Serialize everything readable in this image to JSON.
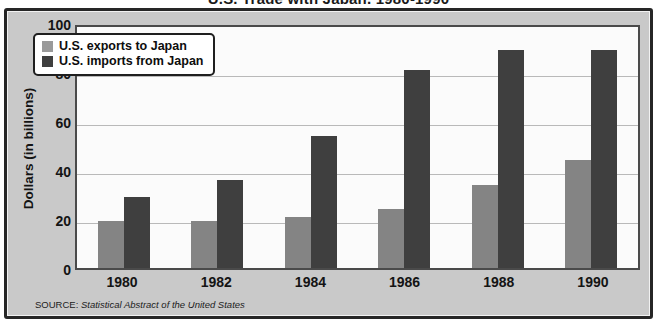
{
  "chart_data": {
    "type": "bar",
    "title": "U.S. Trade with Japan, 1980-1990",
    "xlabel": "",
    "ylabel": "Dollars (in billions)",
    "categories": [
      "1980",
      "1982",
      "1984",
      "1986",
      "1988",
      "1990"
    ],
    "series": [
      {
        "name": "U.S. exports to Japan",
        "color": "#848484",
        "values": [
          19,
          19,
          21,
          24,
          34,
          44
        ]
      },
      {
        "name": "U.S. imports from Japan",
        "color": "#3f3f3f",
        "values": [
          29,
          36,
          54,
          81,
          89,
          89
        ]
      }
    ],
    "ylim": [
      0,
      100
    ],
    "yticks": [
      100,
      80,
      60,
      40,
      20,
      0
    ],
    "grid": true,
    "legend_position": "top-left"
  },
  "source": {
    "label": "SOURCE:",
    "text": "Statistical Abstract of the United States"
  },
  "colors": {
    "panel_background": "#c9c9c9",
    "plot_background": "#fbfbfb",
    "frame": "#262626",
    "gridline": "#b9b9b9",
    "exports_bar": "#848484",
    "imports_bar": "#3f3f3f"
  }
}
